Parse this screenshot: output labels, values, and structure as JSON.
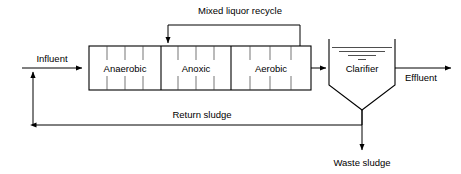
{
  "diagram": {
    "type": "process-flow",
    "background_color": "#ffffff",
    "line_color": "#000000"
  },
  "labels": {
    "influent": "Influent",
    "effluent": "Effluent",
    "mixed_liquor_recycle": "Mixed liquor recycle",
    "return_sludge": "Return sludge",
    "waste_sludge": "Waste sludge"
  },
  "reactor": {
    "zones": [
      {
        "name": "anaerobic",
        "label": "Anaerobic",
        "x": 89,
        "width": 72,
        "compartments": 4
      },
      {
        "name": "anoxic",
        "label": "Anoxic",
        "x": 161,
        "width": 70,
        "compartments": 4
      },
      {
        "name": "aerobic",
        "label": "Aerobic",
        "x": 231,
        "width": 80,
        "compartments": 4
      }
    ],
    "x": 89,
    "y": 46,
    "width": 222,
    "height": 44
  },
  "clarifier": {
    "label": "Clarifier",
    "x": 329,
    "y": 39,
    "width": 66,
    "wall_height": 46,
    "cone_depth": 25,
    "water_surface_lines": 4
  },
  "streams": [
    {
      "name": "influent",
      "label": "Influent",
      "direction": "right"
    },
    {
      "name": "mixed-liquor-recycle",
      "label": "Mixed liquor recycle",
      "direction": "left"
    },
    {
      "name": "effluent",
      "label": "Effluent",
      "direction": "right"
    },
    {
      "name": "return-sludge",
      "label": "Return sludge",
      "direction": "left"
    },
    {
      "name": "waste-sludge",
      "label": "Waste sludge",
      "direction": "down"
    }
  ]
}
